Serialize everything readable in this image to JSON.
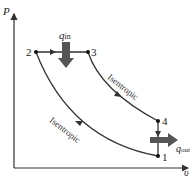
{
  "diagram": {
    "type": "P-v diagram",
    "axes": {
      "y_label": "P",
      "x_label": "υ"
    },
    "states": [
      "1",
      "2",
      "3",
      "4"
    ],
    "heat": {
      "in_label": "q",
      "in_sub": "in",
      "out_label": "q",
      "out_sub": "out"
    },
    "processes": [
      {
        "from": "1",
        "to": "2",
        "label": "Isentropic"
      },
      {
        "from": "2",
        "to": "3",
        "label": ""
      },
      {
        "from": "3",
        "to": "4",
        "label": "Isentropic"
      },
      {
        "from": "4",
        "to": "1",
        "label": ""
      }
    ],
    "colors": {
      "lines": "#333333",
      "arrows": "#444444",
      "heat_arrow": "#555555"
    }
  }
}
